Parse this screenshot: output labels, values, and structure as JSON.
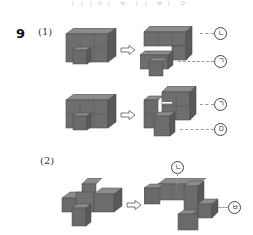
{
  "page": {
    "top_strip_text": "ㅣㅣㅣㅇㅣ ㅂ ㅣㅣ ㅂㅣ ㅁ"
  },
  "question": {
    "number": "9",
    "parts": [
      {
        "label": "(1)",
        "rows": [
          {
            "original": "figure-1a-original",
            "result": "figure-1a-split",
            "labels": [
              {
                "text": "ㄴ",
                "target": "upper piece"
              },
              {
                "text": "ㄱ",
                "target": "lower piece"
              }
            ]
          },
          {
            "original": "figure-1b-original",
            "result": "figure-1b-split",
            "labels": [
              {
                "text": "ㄱ",
                "target": "upper piece"
              },
              {
                "text": "ㅁ",
                "target": "lower piece"
              }
            ]
          }
        ]
      },
      {
        "label": "(2)",
        "rows": [
          {
            "original": "figure-2-original",
            "result": "figure-2-split",
            "labels": [
              {
                "text": "ㄴ",
                "target": "top piece"
              },
              {
                "text": "ㅂ",
                "target": "right piece"
              }
            ]
          }
        ]
      }
    ]
  },
  "colors": {
    "cube_front": "#6e6e6e",
    "cube_top": "#8c8c8c",
    "cube_side": "#5a5a5a",
    "cube_edge": "#4a4a4a",
    "leader_line": "#9a9a9a",
    "arrow_stroke": "#555555"
  }
}
